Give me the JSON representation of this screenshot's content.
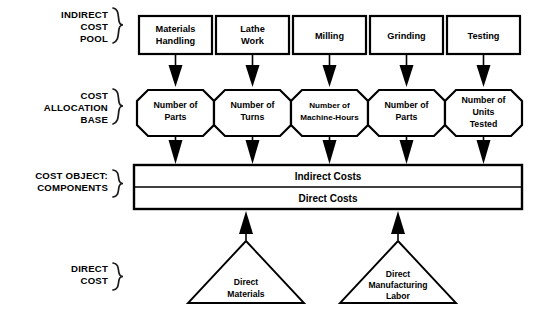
{
  "diagram": {
    "colors": {
      "stroke": "#000000",
      "fill": "#ffffff",
      "background": "#ffffff"
    },
    "row_labels": [
      {
        "id": "indirect-cost-pool",
        "lines": [
          "INDIRECT",
          "COST",
          "POOL"
        ]
      },
      {
        "id": "cost-allocation-base",
        "lines": [
          "COST",
          "ALLOCATION",
          "BASE"
        ]
      },
      {
        "id": "cost-object-components",
        "lines": [
          "COST OBJECT:",
          "COMPONENTS"
        ]
      },
      {
        "id": "direct-cost",
        "lines": [
          "DIRECT",
          "COST"
        ]
      }
    ],
    "cost_pools": [
      {
        "id": "materials-handling",
        "lines": [
          "Materials",
          "Handling"
        ]
      },
      {
        "id": "lathe-work",
        "lines": [
          "Lathe",
          "Work"
        ]
      },
      {
        "id": "milling",
        "lines": [
          "Milling"
        ]
      },
      {
        "id": "grinding",
        "lines": [
          "Grinding"
        ]
      },
      {
        "id": "testing",
        "lines": [
          "Testing"
        ]
      }
    ],
    "allocation_bases": [
      {
        "id": "number-of-parts-1",
        "lines": [
          "Number of",
          "Parts"
        ],
        "narrow": false
      },
      {
        "id": "number-of-turns",
        "lines": [
          "Number of",
          "Turns"
        ],
        "narrow": false
      },
      {
        "id": "number-of-machine-hours",
        "lines": [
          "Number of",
          "Machine-Hours"
        ],
        "narrow": true
      },
      {
        "id": "number-of-parts-2",
        "lines": [
          "Number of",
          "Parts"
        ],
        "narrow": false
      },
      {
        "id": "number-of-units-tested",
        "lines": [
          "Number of",
          "Units",
          "Tested"
        ],
        "narrow": false
      }
    ],
    "cost_object_bars": [
      {
        "id": "indirect-costs",
        "label": "Indirect Costs"
      },
      {
        "id": "direct-costs",
        "label": "Direct Costs"
      }
    ],
    "direct_costs": [
      {
        "id": "direct-materials",
        "lines": [
          "Direct",
          "Materials"
        ]
      },
      {
        "id": "direct-manufacturing-labor",
        "lines": [
          "Direct",
          "Manufacturing",
          "Labor"
        ]
      }
    ]
  }
}
